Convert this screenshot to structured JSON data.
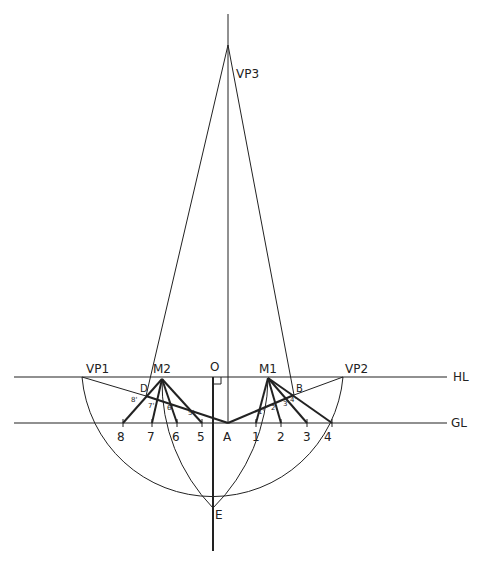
{
  "diagram": {
    "title": "",
    "type": "perspective-construction",
    "labels": {
      "vp1": "VP1",
      "vp2": "VP2",
      "vp3": "VP3",
      "m1": "M1",
      "m2": "M2",
      "o": "O",
      "a": "A",
      "b": "B",
      "d": "D",
      "e": "E",
      "hl": "HL",
      "gl": "GL"
    },
    "ground_ticks_left": [
      "8",
      "7",
      "6",
      "5"
    ],
    "ground_ticks_right": [
      "1",
      "2",
      "3",
      "4"
    ],
    "primed_left": [
      "8'",
      "7'",
      "6'",
      "5'"
    ],
    "primed_right": [
      "1'",
      "2'",
      "3'",
      "4'"
    ],
    "colors": {
      "line": "#222222",
      "background": "#ffffff"
    }
  }
}
